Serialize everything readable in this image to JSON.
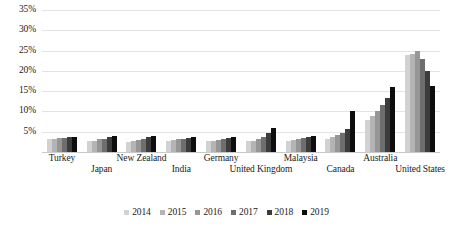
{
  "chart_data": {
    "type": "bar",
    "title": "",
    "subtitle": "",
    "xlabel": "",
    "ylabel": "",
    "ylim": [
      0,
      0.35
    ],
    "y_ticks": [
      "5%",
      "10%",
      "15%",
      "20%",
      "25%",
      "30%",
      "35%"
    ],
    "y_tick_values": [
      5,
      10,
      15,
      20,
      25,
      30,
      35
    ],
    "grid": true,
    "legend_position": "bottom",
    "categories": [
      "Turkey",
      "Japan",
      "New Zealand",
      "India",
      "Germany",
      "United Kingdom",
      "Malaysia",
      "Canada",
      "Australia",
      "United States"
    ],
    "series": [
      {
        "name": "2014",
        "color": "#d2d2d2",
        "values": [
          3.2,
          2.6,
          2.4,
          2.8,
          2.6,
          2.6,
          2.6,
          3.1,
          8.0,
          24.0
        ]
      },
      {
        "name": "2015",
        "color": "#b4b4b4",
        "values": [
          3.3,
          2.8,
          2.7,
          3.0,
          2.8,
          2.8,
          2.9,
          3.6,
          9.0,
          24.2
        ]
      },
      {
        "name": "2016",
        "color": "#969696",
        "values": [
          3.4,
          3.1,
          3.0,
          3.1,
          3.0,
          3.2,
          3.2,
          4.2,
          10.2,
          25.0
        ]
      },
      {
        "name": "2017",
        "color": "#6e6e6e",
        "values": [
          3.5,
          3.3,
          3.3,
          3.3,
          3.2,
          3.8,
          3.4,
          4.8,
          11.6,
          23.0
        ]
      },
      {
        "name": "2018",
        "color": "#3c3c3c",
        "values": [
          3.6,
          3.6,
          3.6,
          3.5,
          3.4,
          4.6,
          3.6,
          5.6,
          13.4,
          20.0
        ]
      },
      {
        "name": "2019",
        "color": "#0d0d0d",
        "values": [
          3.8,
          3.9,
          3.9,
          3.7,
          3.6,
          6.0,
          3.9,
          10.0,
          16.0,
          16.2
        ]
      }
    ]
  }
}
